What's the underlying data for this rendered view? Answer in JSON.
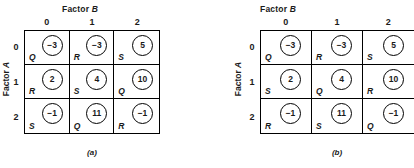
{
  "panels": [
    {
      "id": "a",
      "caption": "(a)",
      "top_title_prefix": "Factor ",
      "top_title_var": "B",
      "side_title_prefix": "Factor ",
      "side_title_var": "A",
      "col_headers": [
        "0",
        "1",
        "2"
      ],
      "row_headers": [
        "0",
        "1",
        "2"
      ],
      "cells": [
        [
          {
            "value": "−3",
            "letter": "Q"
          },
          {
            "value": "−3",
            "letter": "R"
          },
          {
            "value": "5",
            "letter": "S"
          }
        ],
        [
          {
            "value": "2",
            "letter": "R"
          },
          {
            "value": "4",
            "letter": "S"
          },
          {
            "value": "10",
            "letter": "Q"
          }
        ],
        [
          {
            "value": "−1",
            "letter": "S"
          },
          {
            "value": "11",
            "letter": "Q"
          },
          {
            "value": "−1",
            "letter": "R"
          }
        ]
      ]
    },
    {
      "id": "b",
      "caption": "(b)",
      "top_title_prefix": "Factor ",
      "top_title_var": "B",
      "side_title_prefix": "Factor ",
      "side_title_var": "A",
      "col_headers": [
        "0",
        "1",
        "2"
      ],
      "row_headers": [
        "0",
        "1",
        "2"
      ],
      "cells": [
        [
          {
            "value": "−3",
            "letter": "Q"
          },
          {
            "value": "−3",
            "letter": "R"
          },
          {
            "value": "5",
            "letter": "S"
          }
        ],
        [
          {
            "value": "2",
            "letter": "S"
          },
          {
            "value": "4",
            "letter": "Q"
          },
          {
            "value": "10",
            "letter": "R"
          }
        ],
        [
          {
            "value": "−1",
            "letter": "R"
          },
          {
            "value": "11",
            "letter": "S"
          },
          {
            "value": "−1",
            "letter": "Q"
          }
        ]
      ]
    }
  ],
  "chart_data": {
    "type": "table",
    "xlabel": "Factor B",
    "ylabel": "Factor A",
    "categories_x": [
      "0",
      "1",
      "2"
    ],
    "categories_y": [
      "0",
      "1",
      "2"
    ],
    "panels": [
      {
        "name": "(a)",
        "values": [
          [
            -3,
            -3,
            5
          ],
          [
            2,
            4,
            10
          ],
          [
            -1,
            11,
            -1
          ]
        ],
        "treatments": [
          [
            "Q",
            "R",
            "S"
          ],
          [
            "R",
            "S",
            "Q"
          ],
          [
            "S",
            "Q",
            "R"
          ]
        ]
      },
      {
        "name": "(b)",
        "values": [
          [
            -3,
            -3,
            5
          ],
          [
            2,
            4,
            10
          ],
          [
            -1,
            11,
            -1
          ]
        ],
        "treatments": [
          [
            "Q",
            "R",
            "S"
          ],
          [
            "S",
            "Q",
            "R"
          ],
          [
            "R",
            "S",
            "Q"
          ]
        ]
      }
    ],
    "grid": true,
    "legend": "none"
  }
}
